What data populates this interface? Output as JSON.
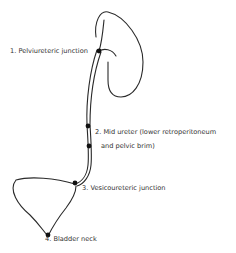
{
  "diagram": {
    "colors": {
      "stroke": "#2a2a2a",
      "text": "#333333",
      "background": "#ffffff"
    },
    "labels": [
      {
        "id": "1",
        "text": "1. Pelviureteric junction"
      },
      {
        "id": "2a",
        "text": "2. Mid ureter (lower retroperitoneum"
      },
      {
        "id": "2b",
        "text": "and pelvic brim)"
      },
      {
        "id": "3",
        "text": "3. Vesicoureteric junction"
      },
      {
        "id": "4",
        "text": "4. Bladder neck"
      }
    ],
    "structures": [
      "kidney",
      "ureter",
      "bladder"
    ]
  }
}
